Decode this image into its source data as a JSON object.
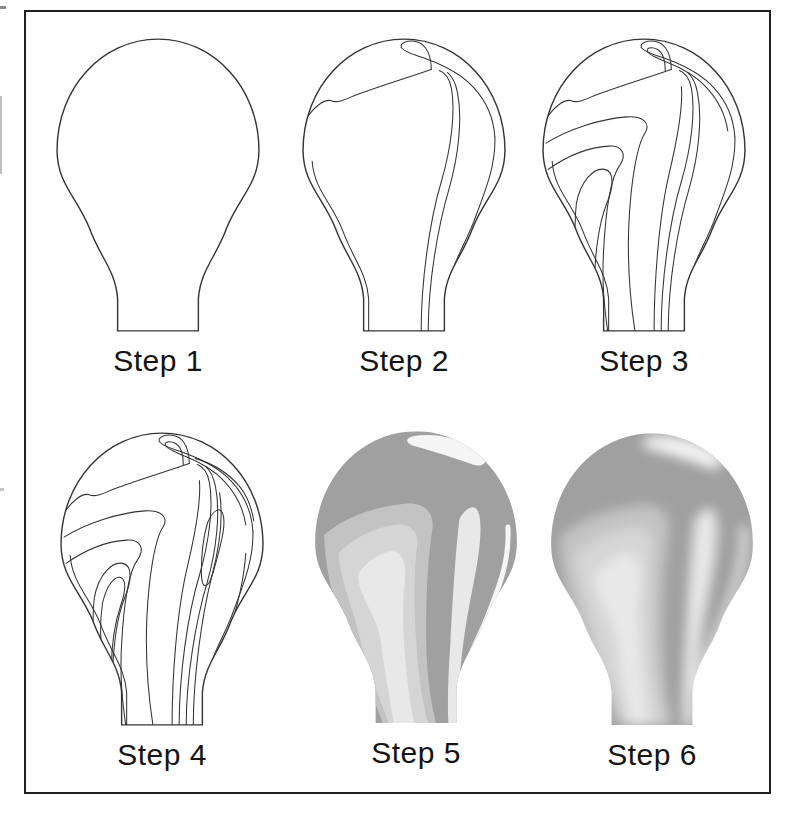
{
  "figure": {
    "colors": {
      "page_bg": "#ffffff",
      "frame": "#1f1f1f",
      "line": "#343434",
      "label": "#141414",
      "shade_dark": "#a0a0a0",
      "shade_mid": "#c3c3c3",
      "shade_light": "#d5d5d5",
      "shade_lighter": "#e8e8e8",
      "highlight": "#f5f5f5"
    },
    "panels": [
      {
        "label": "Step 1"
      },
      {
        "label": "Step 2"
      },
      {
        "label": "Step 3"
      },
      {
        "label": "Step 4"
      },
      {
        "label": "Step 5"
      },
      {
        "label": "Step 6"
      }
    ]
  }
}
